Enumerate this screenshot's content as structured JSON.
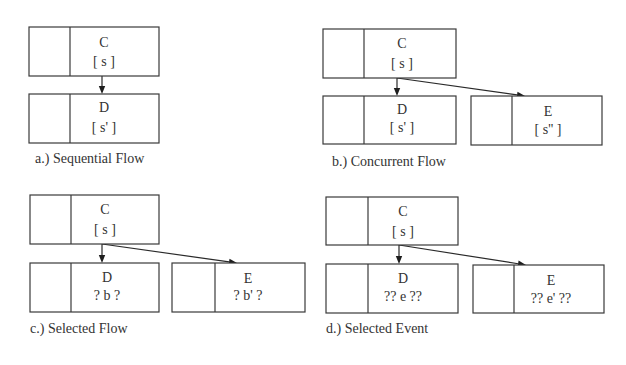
{
  "panels": [
    {
      "id": "a",
      "caption": "a.) Sequential Flow",
      "caption_pos": [
        35,
        163
      ],
      "boxes": [
        {
          "name": "C",
          "x": 29,
          "y": 27,
          "w": 130,
          "h": 49,
          "divider": 70,
          "cx": 104,
          "title": "C",
          "sub": "[ s ]",
          "title_y": 47,
          "sub_y": 66
        },
        {
          "name": "D",
          "x": 29,
          "y": 94,
          "w": 130,
          "h": 49,
          "divider": 70,
          "cx": 104,
          "title": "D",
          "sub": "[ s' ]",
          "title_y": 112,
          "sub_y": 132
        }
      ],
      "arrows": [
        {
          "from": [
            102,
            76
          ],
          "to": [
            102,
            94
          ]
        }
      ]
    },
    {
      "id": "b",
      "caption": "b.) Concurrent Flow",
      "caption_pos": [
        332,
        166
      ],
      "boxes": [
        {
          "name": "C",
          "x": 323,
          "y": 29,
          "w": 133,
          "h": 49,
          "divider": 364,
          "cx": 402,
          "title": "C",
          "sub": "[ s ]",
          "title_y": 48,
          "sub_y": 68
        },
        {
          "name": "D",
          "x": 323,
          "y": 96,
          "w": 133,
          "h": 48,
          "divider": 364,
          "cx": 402,
          "title": "D",
          "sub": "[ s' ]",
          "title_y": 114,
          "sub_y": 132
        },
        {
          "name": "E",
          "x": 471,
          "y": 96,
          "w": 131,
          "h": 49,
          "divider": 512,
          "cx": 548,
          "title": "E",
          "sub": "[ s'' ]",
          "title_y": 116,
          "sub_y": 134
        }
      ],
      "arrows": [
        {
          "from": [
            397,
            78
          ],
          "to": [
            397,
            96
          ]
        },
        {
          "from": [
            397,
            78
          ],
          "to": [
            525,
            96
          ]
        }
      ]
    },
    {
      "id": "c",
      "caption": "c.) Selected Flow",
      "caption_pos": [
        30,
        333
      ],
      "boxes": [
        {
          "name": "C",
          "x": 30,
          "y": 195,
          "w": 129,
          "h": 49,
          "divider": 71,
          "cx": 105,
          "title": "C",
          "sub": "[ s ]",
          "title_y": 214,
          "sub_y": 234
        },
        {
          "name": "D",
          "x": 30,
          "y": 263,
          "w": 129,
          "h": 49,
          "divider": 71,
          "cx": 107,
          "title": "D",
          "sub": "? b ?",
          "title_y": 282,
          "sub_y": 300
        },
        {
          "name": "E",
          "x": 172,
          "y": 263,
          "w": 133,
          "h": 49,
          "divider": 215,
          "cx": 248,
          "title": "E",
          "sub": "? b' ?",
          "title_y": 283,
          "sub_y": 300
        }
      ],
      "arrows": [
        {
          "from": [
            102,
            244
          ],
          "to": [
            102,
            263
          ]
        },
        {
          "from": [
            102,
            244
          ],
          "to": [
            237,
            263
          ]
        }
      ]
    },
    {
      "id": "d",
      "caption": "d.) Selected Event",
      "caption_pos": [
        326,
        333
      ],
      "boxes": [
        {
          "name": "C",
          "x": 326,
          "y": 197,
          "w": 132,
          "h": 48,
          "divider": 368,
          "cx": 403,
          "title": "C",
          "sub": "[ s ]",
          "title_y": 216,
          "sub_y": 236
        },
        {
          "name": "D",
          "x": 326,
          "y": 264,
          "w": 132,
          "h": 49,
          "divider": 368,
          "cx": 403,
          "title": "D",
          "sub": "?? e ??",
          "title_y": 283,
          "sub_y": 301
        },
        {
          "name": "E",
          "x": 473,
          "y": 265,
          "w": 131,
          "h": 48,
          "divider": 514,
          "cx": 551,
          "title": "E",
          "sub": "?? e' ??",
          "title_y": 285,
          "sub_y": 303
        }
      ],
      "arrows": [
        {
          "from": [
            399,
            245
          ],
          "to": [
            399,
            264
          ]
        },
        {
          "from": [
            399,
            245
          ],
          "to": [
            526,
            265
          ]
        }
      ]
    }
  ],
  "colors": {
    "stroke": "#3a3a3a",
    "text": "#333333",
    "background": "#ffffff"
  }
}
